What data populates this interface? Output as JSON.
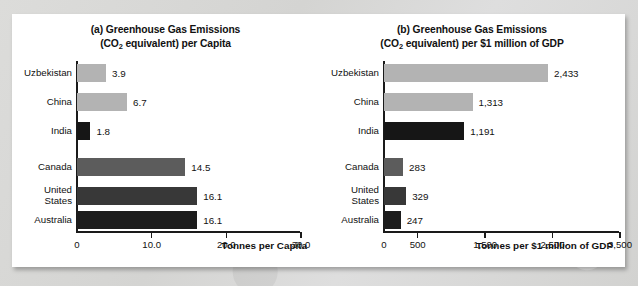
{
  "chart_data": [
    {
      "type": "bar",
      "orientation": "horizontal",
      "panel": "a",
      "title_line1": "(a) Greenhouse Gas Emissions",
      "title_line2_pre": "(CO",
      "title_line2_sub": "2",
      "title_line2_post": " equivalent) per Capita",
      "title": "(a) Greenhouse Gas Emissions (CO2 equivalent) per Capita",
      "xlabel": "Tonnes per Capita",
      "ylabel": "",
      "xlim": [
        0,
        30
      ],
      "xticks": [
        0,
        10,
        20,
        30
      ],
      "xtick_labels": [
        "0",
        "10.0",
        "20.0",
        "30.0"
      ],
      "grid": false,
      "legend": "none",
      "categories": [
        "Uzbekistan",
        "China",
        "India",
        "Canada",
        "United States",
        "Australia"
      ],
      "values": [
        3.9,
        6.7,
        1.8,
        14.5,
        16.1,
        16.1
      ],
      "value_labels": [
        "3.9",
        "6.7",
        "1.8",
        "14.5",
        "16.1",
        "16.1"
      ],
      "bar_colors": [
        "#b3b3b3",
        "#b3b3b3",
        "#161616",
        "#5c5c5c",
        "#383838",
        "#1c1c1c"
      ]
    },
    {
      "type": "bar",
      "orientation": "horizontal",
      "panel": "b",
      "title_line1": "(b) Greenhouse Gas Emissions",
      "title_line2_pre": "(CO",
      "title_line2_sub": "2",
      "title_line2_post": " equivalent) per $1 million of GDP",
      "title": "(b) Greenhouse Gas Emissions (CO2 equivalent) per $1 million of GDP",
      "xlabel": "Tonnes per $1 million of GDP",
      "ylabel": "",
      "xlim": [
        0,
        3500
      ],
      "xticks": [
        0,
        500,
        1500,
        2500,
        3500
      ],
      "xtick_labels": [
        "0",
        "500",
        "1,500",
        "2,500",
        "3,500"
      ],
      "grid": false,
      "legend": "none",
      "categories": [
        "Uzbekistan",
        "China",
        "India",
        "Canada",
        "United States",
        "Australia"
      ],
      "values": [
        2433,
        1313,
        1191,
        283,
        329,
        247
      ],
      "value_labels": [
        "2,433",
        "1,313",
        "1,191",
        "283",
        "329",
        "247"
      ],
      "bar_colors": [
        "#b3b3b3",
        "#b3b3b3",
        "#161616",
        "#5c5c5c",
        "#383838",
        "#1c1c1c"
      ]
    }
  ],
  "labels": {
    "uzbekistan": "Uzbekistan",
    "china": "China",
    "india": "India",
    "canada": "Canada",
    "united_states": "United\nStates",
    "australia": "Australia"
  },
  "colors": {
    "card_background": "#ffffff",
    "page_background": "#d9d9d7",
    "axis": "#1a1a1a",
    "text": "#111111",
    "bar_light_gray": "#b3b3b3",
    "bar_mid_gray": "#5c5c5c",
    "bar_dark_gray": "#383838",
    "bar_black": "#161616"
  }
}
